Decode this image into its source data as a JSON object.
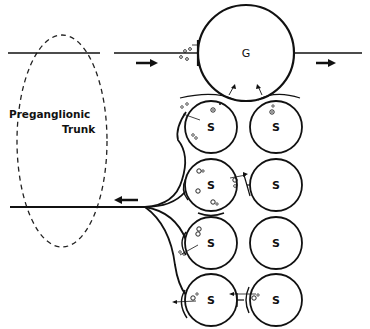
{
  "diagram": {
    "label_preganglionic": "Preganglionic",
    "label_trunk": "Trunk",
    "ganglion_label": "G",
    "small_cell_label": "S",
    "cells": [
      {
        "id": "G",
        "label": "G",
        "cx": 246,
        "cy": 53,
        "r": 48
      },
      {
        "id": "S1L",
        "label": "S",
        "cx": 211,
        "cy": 127,
        "r": 26
      },
      {
        "id": "S1R",
        "label": "S",
        "cx": 276,
        "cy": 127,
        "r": 26
      },
      {
        "id": "S2L",
        "label": "S",
        "cx": 211,
        "cy": 185,
        "r": 26
      },
      {
        "id": "S2R",
        "label": "S",
        "cx": 276,
        "cy": 185,
        "r": 26
      },
      {
        "id": "S3L",
        "label": "S",
        "cx": 211,
        "cy": 243,
        "r": 26
      },
      {
        "id": "S3R",
        "label": "S",
        "cx": 276,
        "cy": 243,
        "r": 26
      },
      {
        "id": "S4L",
        "label": "S",
        "cx": 211,
        "cy": 300,
        "r": 26
      },
      {
        "id": "S4R",
        "label": "S",
        "cx": 276,
        "cy": 300,
        "r": 26
      }
    ],
    "arrows": [
      {
        "direction": "right",
        "position": "top-axon-input"
      },
      {
        "direction": "right",
        "position": "top-axon-output"
      },
      {
        "direction": "left",
        "position": "lower-axon-output"
      }
    ]
  }
}
